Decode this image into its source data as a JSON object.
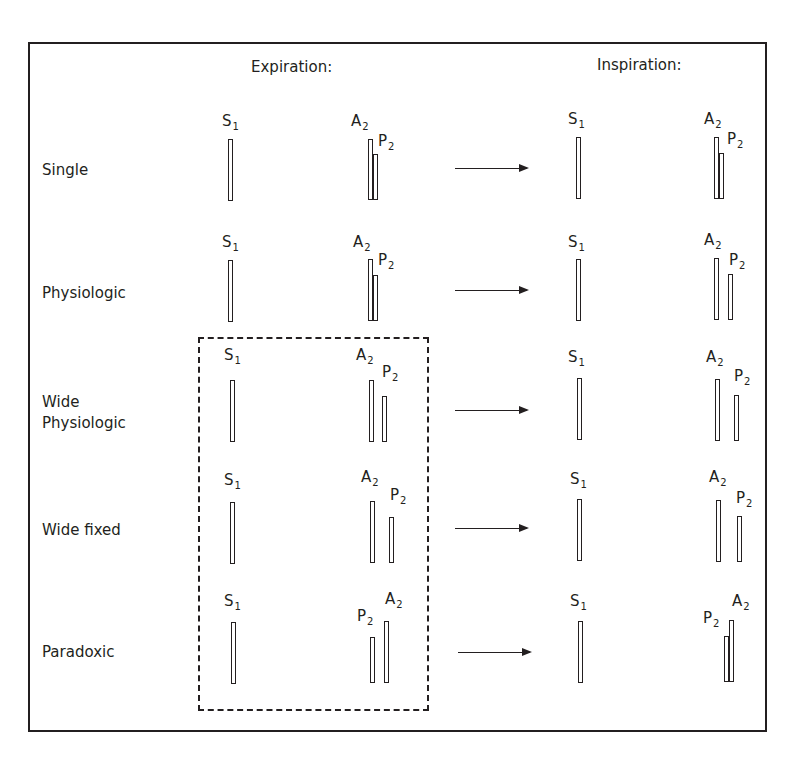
{
  "columns": {
    "expiration": "Expiration:",
    "inspiration": "Inspiration:"
  },
  "sound_labels": {
    "S": "S",
    "A": "A",
    "P": "P",
    "s_sub": "1",
    "a_sub": "2",
    "p_sub": "2"
  },
  "rows": [
    {
      "label": "Single",
      "expiration": "A2 and P2 nearly superimposed (P2 slightly later/shorter)",
      "inspiration": "A2 and P2 nearly superimposed"
    },
    {
      "label": "Physiologic",
      "expiration": "A2 and P2 nearly superimposed",
      "inspiration": "A2 and P2 split"
    },
    {
      "label": "Wide\nPhysiologic",
      "expiration": "A2 and P2 split",
      "inspiration": "A2 and P2 widely split"
    },
    {
      "label": "Wide fixed",
      "expiration": "A2 and P2 widely split",
      "inspiration": "A2 and P2 widely split (unchanged)"
    },
    {
      "label": "Paradoxic",
      "expiration": "P2 precedes A2 (split)",
      "inspiration": "P2 and A2 nearly superimposed"
    }
  ],
  "highlight_box": {
    "style": "dashed",
    "rows": [
      "Wide Physiologic",
      "Wide fixed",
      "Paradoxic"
    ],
    "column": "Expiration"
  },
  "colors": {
    "line": "#231f20",
    "background": "#ffffff"
  }
}
